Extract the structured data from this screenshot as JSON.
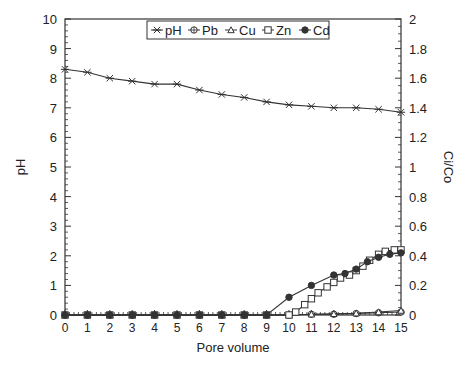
{
  "chart_data": {
    "type": "line",
    "title": "",
    "xlabel": "Pore volume",
    "ylabel": "pH",
    "y2label": "Ci/Co",
    "xlim": [
      0,
      15
    ],
    "ylim": [
      0,
      10
    ],
    "y2lim": [
      0,
      2
    ],
    "xticks": [
      "0",
      "1",
      "2",
      "3",
      "4",
      "5",
      "6",
      "7",
      "8",
      "9",
      "10",
      "11",
      "12",
      "13",
      "14",
      "15"
    ],
    "yticks": [
      "0",
      "1",
      "2",
      "3",
      "4",
      "5",
      "6",
      "7",
      "8",
      "9",
      "10"
    ],
    "y2ticks": [
      "0",
      "0.2",
      "0.4",
      "0.6",
      "0.8",
      "1",
      "1.2",
      "1.4",
      "1.6",
      "1.8",
      "2"
    ],
    "grid": false,
    "legend_position": "top-center",
    "series": [
      {
        "name": "pH",
        "axis": "left",
        "marker": "x-star",
        "x": [
          0,
          1,
          2,
          3,
          4,
          5,
          6,
          7,
          8,
          9,
          10,
          11,
          12,
          13,
          14,
          15
        ],
        "y": [
          8.3,
          8.2,
          8.0,
          7.9,
          7.8,
          7.8,
          7.6,
          7.45,
          7.35,
          7.2,
          7.1,
          7.05,
          7.0,
          7.0,
          6.95,
          6.85
        ]
      },
      {
        "name": "Pb",
        "axis": "right",
        "marker": "circle-plus",
        "x": [
          0,
          1,
          2,
          3,
          4,
          5,
          6,
          7,
          8,
          9,
          10,
          11,
          12,
          13,
          14,
          15
        ],
        "y": [
          0,
          0,
          0,
          0,
          0,
          0,
          0,
          0,
          0,
          0,
          0,
          0.005,
          0.005,
          0.01,
          0.015,
          0.02
        ]
      },
      {
        "name": "Cu",
        "axis": "right",
        "marker": "triangle",
        "x": [
          0,
          1,
          2,
          3,
          4,
          5,
          6,
          7,
          8,
          9,
          10,
          11,
          12,
          13,
          14,
          15
        ],
        "y": [
          0,
          0,
          0,
          0,
          0,
          0,
          0,
          0,
          0,
          0,
          0,
          0.005,
          0.008,
          0.012,
          0.02,
          0.03
        ]
      },
      {
        "name": "Zn",
        "axis": "right",
        "marker": "square",
        "x": [
          0,
          1,
          2,
          3,
          4,
          5,
          6,
          7,
          8,
          9,
          10,
          10.3,
          10.7,
          11,
          11.3,
          11.7,
          12,
          12.3,
          12.7,
          13,
          13.3,
          13.6,
          14,
          14.3,
          14.7,
          15
        ],
        "y": [
          0,
          0,
          0,
          0,
          0,
          0,
          0,
          0,
          0,
          0,
          0,
          0.02,
          0.07,
          0.11,
          0.15,
          0.19,
          0.22,
          0.25,
          0.27,
          0.3,
          0.33,
          0.37,
          0.41,
          0.43,
          0.44,
          0.44
        ]
      },
      {
        "name": "Cd",
        "axis": "right",
        "marker": "filled-circle",
        "x": [
          0,
          1,
          2,
          3,
          4,
          5,
          6,
          7,
          8,
          9,
          10,
          11,
          12,
          12.5,
          13,
          13.5,
          14,
          14.5,
          15
        ],
        "y": [
          0,
          0,
          0,
          0,
          0,
          0,
          0,
          0,
          0,
          0,
          0.12,
          0.2,
          0.27,
          0.28,
          0.31,
          0.36,
          0.39,
          0.41,
          0.42
        ]
      }
    ]
  },
  "colors": {
    "line": "#333333",
    "axis": "#333333",
    "background": "#ffffff"
  }
}
